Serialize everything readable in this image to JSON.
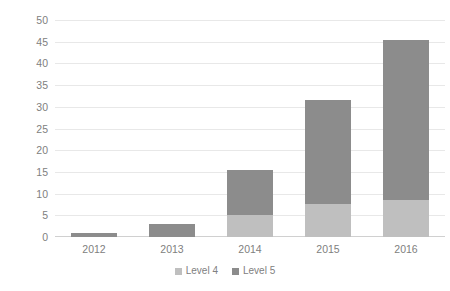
{
  "chart_data": {
    "type": "bar",
    "subtype": "stacked-bar",
    "title": "",
    "xlabel": "",
    "ylabel": "Number of Included Publications",
    "categories": [
      "2012",
      "2013",
      "2014",
      "2015",
      "2016"
    ],
    "series": [
      {
        "name": "Level 4",
        "color": "#bfbfbf",
        "values": [
          0,
          0,
          5,
          7.5,
          8.5
        ]
      },
      {
        "name": "Level 5",
        "color": "#8c8c8c",
        "values": [
          1,
          3,
          10.5,
          24,
          37
        ]
      }
    ],
    "totals": [
      1,
      3,
      15.5,
      31.5,
      45.5
    ],
    "ylim": [
      0,
      50
    ],
    "ytick_step": 5,
    "yticks": [
      "50",
      "45",
      "40",
      "35",
      "30",
      "25",
      "20",
      "15",
      "10",
      "5",
      "0"
    ],
    "grid": true,
    "grid_axis": "y",
    "legend_position": "bottom",
    "legend": [
      "Level 4",
      "Level 5"
    ]
  },
  "colors": {
    "level4": "#bfbfbf",
    "level5": "#8c8c8c",
    "gridline": "#e8e8e8",
    "baseline": "#d0d0d0",
    "tick_text": "#808080",
    "axis_title_text": "#595959",
    "background": "#ffffff"
  }
}
